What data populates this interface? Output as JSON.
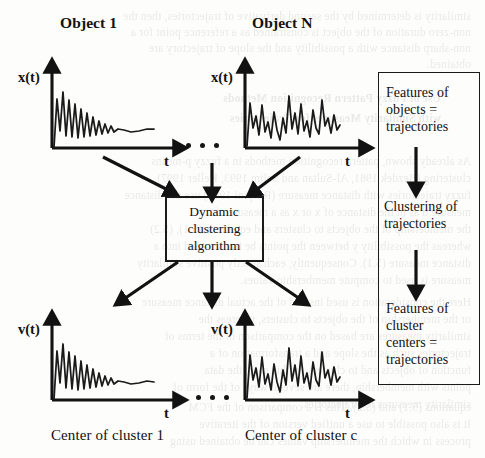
{
  "figure": {
    "background_color": "#fdfdfc",
    "ink_color": "#1a1a1a"
  },
  "top_plots": [
    {
      "heading": "Object 1",
      "y_axis_label": "x(t)",
      "x_axis_label": "t",
      "waveform": "damped-oscillation"
    },
    {
      "heading": "Object N",
      "y_axis_label": "x(t)",
      "x_axis_label": "t",
      "waveform": "irregular-oscillation"
    }
  ],
  "bottom_plots": [
    {
      "y_axis_label": "v(t)",
      "x_axis_label": "t",
      "caption": "Center of cluster 1",
      "waveform": "damped-oscillation"
    },
    {
      "y_axis_label": "v(t)",
      "x_axis_label": "t",
      "caption": "Center of cluster c",
      "waveform": "irregular-oscillation"
    }
  ],
  "ellipsis": {
    "top": "• • •",
    "bottom": "• • •"
  },
  "process_box": {
    "line1": "Dynamic",
    "line2": "clustering",
    "line3": "algorithm"
  },
  "side_panel": {
    "steps": [
      {
        "lines": [
          "Features of",
          "objects =",
          "trajectories"
        ]
      },
      {
        "lines": [
          "Clustering of",
          "trajectories"
        ]
      },
      {
        "lines": [
          "Features of",
          "cluster",
          "centers =",
          "trajectories"
        ]
      }
    ]
  },
  "bleed_through": {
    "lines": [
      "similarity is determined by the second derivative of trajectories, then the",
      "non-zero duration of the object is constrained as a reference point for a",
      "non-sharp distance with a possibility and the slope of trajectory are",
      "obtained.",
      "Use of Fuzzy Pattern Recognition Methods",
      "with Similarity Measures for Trajectories",
      "As already shown, pattern recognition methods in a fuzzy p-means",
      "clustering (Bezdek 1981, Al-Sultan and Selim 1993, Keller 1997)",
      "fuzzy trajectories with distance measure (Ruspini 1969) use the distance",
      "measure d   as in the distance of x  or x  as a measure of",
      "the membership of the objects to clusters and equations (5.1), (5.2)",
      "whereas the possibility y between the points be transformed into a",
      "distance measure (5.1). Consequently, each strictly positive similarity",
      "measure is used to compute membership values.",
      "Here the consideration is used instead of the actual distance measure",
      "or the membership of the objects to clusters, whereas the",
      "similarity measures are based on the comparison of the terms of",
      "trajectories such as the slope and a transformation of a",
      "function of objects and to clusters. In this case, the data",
      "points with membership, there are several ways of the form of",
      "similarity measures for trajectories.",
      "It is also possible to use a unified version of the iterative",
      "process in which the membership values can be obtained using",
      "equations (5.1) and (5.2). This is a comparison of the FCM"
    ]
  }
}
